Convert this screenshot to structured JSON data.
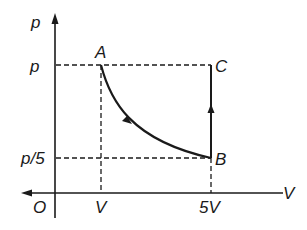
{
  "diagram": {
    "type": "p-V thermodynamic cycle",
    "axes": {
      "y_label": "p",
      "x_label": "V",
      "origin_label": "O"
    },
    "tick_labels": {
      "y": [
        "p",
        "p/5"
      ],
      "x": [
        "V",
        "5V"
      ]
    },
    "points": [
      {
        "name": "A",
        "p": "p",
        "V": "V"
      },
      {
        "name": "B",
        "p": "p/5",
        "V": "5V"
      },
      {
        "name": "C",
        "p": "p",
        "V": "5V"
      }
    ],
    "processes": [
      {
        "from": "A",
        "to": "B",
        "shape": "curve (isothermal)",
        "arrow": "toward B"
      },
      {
        "from": "B",
        "to": "C",
        "shape": "vertical line (isochoric)",
        "arrow": "upward"
      }
    ],
    "guide_lines": "dashed"
  },
  "labels": {
    "p_axis": "p",
    "v_axis": "V",
    "origin": "O",
    "tick_p": "p",
    "tick_p5": "p/5",
    "tick_v": "V",
    "tick_5v": "5V",
    "point_a": "A",
    "point_b": "B",
    "point_c": "C"
  },
  "colors": {
    "ink": "#1a1a1a",
    "background": "#ffffff"
  }
}
